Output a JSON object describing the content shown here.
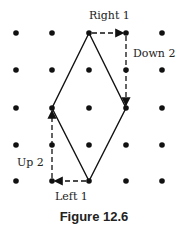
{
  "figure": {
    "caption": "Figure 12.6",
    "grid": {
      "cols": 5,
      "rows": 5,
      "x": [
        16,
        52,
        89,
        126,
        162
      ],
      "y": [
        33,
        70,
        108,
        145,
        181
      ],
      "dot_color": "#111111"
    },
    "shape": {
      "type": "rhombus",
      "vertices": [
        [
          2,
          0
        ],
        [
          3,
          2
        ],
        [
          2,
          4
        ],
        [
          1,
          2
        ]
      ]
    },
    "annotations": [
      {
        "label": "Right 1",
        "from": [
          2,
          0
        ],
        "to": [
          3,
          0
        ]
      },
      {
        "label": "Down 2",
        "from": [
          3,
          0
        ],
        "to": [
          3,
          2
        ]
      },
      {
        "label": "Left 1",
        "from": [
          2,
          4
        ],
        "to": [
          1,
          4
        ]
      },
      {
        "label": "Up 2",
        "from": [
          1,
          4
        ],
        "to": [
          1,
          2
        ]
      }
    ]
  }
}
